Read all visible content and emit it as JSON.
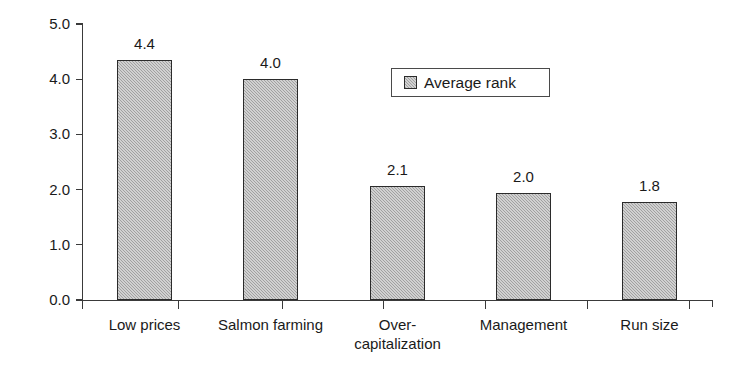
{
  "chart_data": {
    "type": "bar",
    "title": "",
    "subtitle": "",
    "xlabel": "",
    "ylabel": "Average rank",
    "ylim": [
      0.0,
      5.0
    ],
    "ytick_labels": [
      "5.0",
      "4.0",
      "3.0",
      "2.0",
      "1.0",
      "0.0"
    ],
    "ytick_values": [
      5.0,
      4.0,
      3.0,
      2.0,
      1.0,
      0.0
    ],
    "grid": false,
    "legend_position": "inside-upper-center",
    "legend_entries": [
      "Average rank"
    ],
    "categories": [
      "Low prices",
      "Salmon farming",
      "Over-\ncapitalization",
      "Management",
      "Run size"
    ],
    "series": [
      {
        "name": "Average rank",
        "values": [
          4.35,
          4.0,
          2.07,
          1.93,
          1.78
        ],
        "data_labels": [
          "4.4",
          "4.0",
          "2.1",
          "2.0",
          "1.8"
        ],
        "fill_color": "#b0b0b0",
        "edge_color": "#2b2b2b"
      }
    ],
    "axis_color": "#3a3a3a",
    "background_color": "#ffffff"
  },
  "layout": {
    "plot_left": 82,
    "plot_right": 713,
    "plot_top": 23,
    "baseline_y": 300,
    "px_per_unit": 55.2,
    "bar_width": 55,
    "bar_left_positions": [
      117,
      243,
      370,
      496,
      622
    ],
    "xtick_positions": [
      82,
      178,
      282,
      383,
      485,
      587,
      689
    ]
  }
}
